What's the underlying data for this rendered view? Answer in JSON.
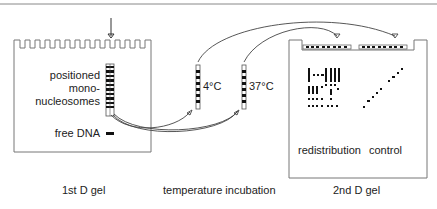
{
  "diagram": {
    "first_gel": {
      "caption": "1st D gel",
      "band_label_line1": "positioned",
      "band_label_line2": "mono-",
      "band_label_line3": "nucleosomes",
      "free_dna_label": "free DNA"
    },
    "incubation": {
      "caption": "temperature incubation",
      "lane1_label": "4°C",
      "lane2_label": "37°C"
    },
    "second_gel": {
      "caption": "2nd D gel",
      "left_label": "redistribution",
      "right_label": "control"
    },
    "colors": {
      "line": "#555555",
      "band": "#111111",
      "border": "#777777"
    }
  }
}
